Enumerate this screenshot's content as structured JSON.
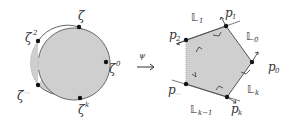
{
  "diagram": {
    "left": {
      "shape": "disk",
      "fill": "#cfcfcf",
      "stroke": "#555555",
      "labels": {
        "zeta": "ζ",
        "zeta2_base": "ζ",
        "zeta2_exp": "2",
        "zeta0_base": "ζ",
        "zeta0_exp": "0",
        "zetak_base": "ζ",
        "zetak_exp": "k",
        "zetam_base": "ζ",
        "zetam_exp": "···"
      }
    },
    "map": {
      "symbol": "ψ",
      "arrow": "→"
    },
    "right": {
      "shape": "pentagon",
      "fill": "#cfcfcf",
      "stroke": "#555555",
      "points": {
        "p1": "p",
        "p1_sub": "1",
        "p2": "p",
        "p2_sub": "2",
        "p0": "p",
        "p0_sub": "0",
        "pk": "p",
        "pk_sub": "k",
        "pm": "p",
        "pm_sub": "···"
      },
      "lines": {
        "L1": "𝕃",
        "L1_sub": "1",
        "L0": "𝕃",
        "L0_sub": "0",
        "Lk": "𝕃",
        "Lk_sub": "k",
        "Lkm1": "𝕃",
        "Lkm1_sub": "k−1"
      }
    }
  }
}
